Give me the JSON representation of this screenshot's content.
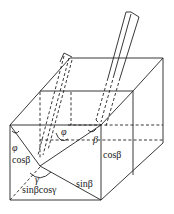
{
  "diagram": {
    "type": "3d-geometry-light-beam-through-box",
    "labels": {
      "phi_upper": "φ",
      "phi_left": "φ",
      "cos_beta_left": "cosβ",
      "beta": "β",
      "cos_beta_right": "cosβ",
      "gamma": "γ",
      "sin_beta": "sinβ",
      "sin_beta_cos_gamma": "sinβcosγ"
    },
    "colors": {
      "line": "#222222",
      "background": "#ffffff"
    }
  }
}
